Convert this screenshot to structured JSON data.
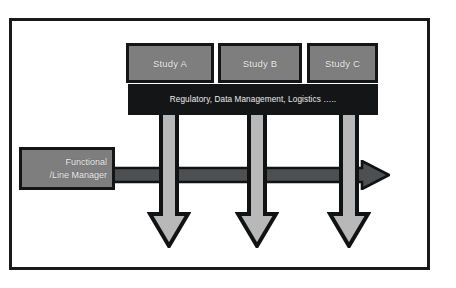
{
  "diagram": {
    "frame": {
      "name": "outer-border"
    },
    "study_boxes": [
      {
        "id": "study-a",
        "label": "Study A"
      },
      {
        "id": "study-b",
        "label": "Study B"
      },
      {
        "id": "study-c",
        "label": "Study C"
      }
    ],
    "services_banner": {
      "label": "Regulatory, Data Management, Logistics ….."
    },
    "manager_box": {
      "line1": "Functional",
      "line2": "/Line Manager"
    },
    "arrows": {
      "horizontal": {
        "direction": "right",
        "name": "functional-authority-arrow"
      },
      "vertical": [
        {
          "direction": "down",
          "name": "study-a-arrow"
        },
        {
          "direction": "down",
          "name": "study-b-arrow"
        },
        {
          "direction": "down",
          "name": "study-c-arrow"
        }
      ]
    },
    "colors": {
      "box_fill": "#7e7e7e",
      "box_border": "#141516",
      "banner_fill": "#141516",
      "text": "#f2f2f2",
      "arrow_shaft": "#b8b8b8",
      "arrow_outline": "#141516",
      "h_arrow_fill": "#4d4f50",
      "background": "#ffffff"
    }
  }
}
